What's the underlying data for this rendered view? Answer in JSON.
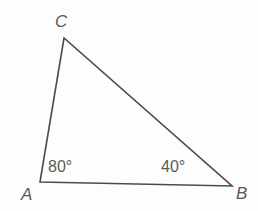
{
  "figure": {
    "type": "triangle-diagram",
    "background_color": "#fdfdfd",
    "stroke_color": "#4a4a4a",
    "label_color": "#5a5a5a",
    "stroke_width": 1.6
  },
  "vertices": {
    "a": {
      "label": "A",
      "x": 40,
      "y": 182
    },
    "b": {
      "label": "B",
      "x": 232,
      "y": 186
    },
    "c": {
      "label": "C",
      "x": 64,
      "y": 38
    }
  },
  "angles": {
    "at_a": {
      "label": "80°",
      "value": 80
    },
    "at_b": {
      "label": "40°",
      "value": 40
    }
  },
  "chart_data": {
    "type": "diagram",
    "title": "",
    "shape": "triangle",
    "points": [
      {
        "name": "A",
        "x": 40,
        "y": 182
      },
      {
        "name": "C",
        "x": 64,
        "y": 38
      },
      {
        "name": "B",
        "x": 232,
        "y": 186
      }
    ],
    "edges": [
      {
        "from": "A",
        "to": "C"
      },
      {
        "from": "C",
        "to": "B"
      },
      {
        "from": "A",
        "to": "B"
      }
    ],
    "annotations": [
      {
        "text": "80°",
        "at": "A"
      },
      {
        "text": "40°",
        "at": "B"
      }
    ]
  }
}
